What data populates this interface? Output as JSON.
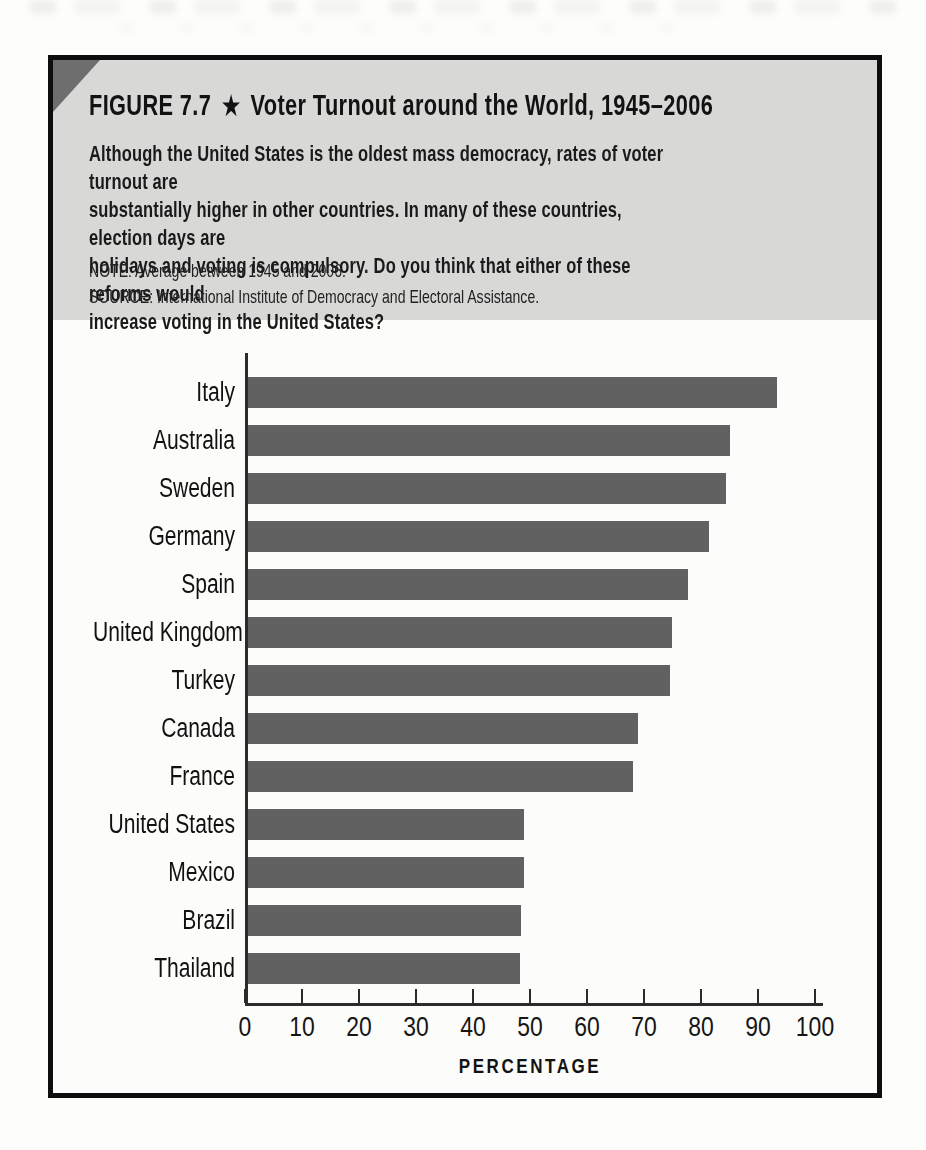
{
  "figure": {
    "label": "FIGURE 7.7",
    "star": "★",
    "title": "Voter Turnout around the World, 1945–2006",
    "description": "Although the United States is the oldest mass democracy, rates of voter turnout are\nsubstantially higher in other countries. In many of these countries, election days are\nholidays and voting is compulsory. Do you think that either of these reforms would\nincrease voting in the United States?",
    "note": "NOTE: Average between 1945 and 2006.",
    "source": "SOURCE: International Institute of Democracy and Electoral Assistance."
  },
  "colors": {
    "header_bg": "#d8d8d7",
    "corner_triangle": "#6e6e6e",
    "border": "#0e0e0e",
    "bar": "#616161",
    "axis": "#2b2b2b"
  },
  "chart_data": {
    "type": "bar",
    "orientation": "horizontal",
    "title": "Voter Turnout around the World, 1945–2006",
    "categories": [
      "Italy",
      "Australia",
      "Sweden",
      "Germany",
      "Spain",
      "United Kingdom",
      "Turkey",
      "Canada",
      "France",
      "United States",
      "Mexico",
      "Brazil",
      "Thailand"
    ],
    "values": [
      93.3,
      85.1,
      84.4,
      81.4,
      77.7,
      74.9,
      74.6,
      68.9,
      68.1,
      48.9,
      48.9,
      48.5,
      48.2
    ],
    "xlabel": "PERCENTAGE",
    "x_ticks": [
      0,
      10,
      20,
      30,
      40,
      50,
      60,
      70,
      80,
      90,
      100
    ],
    "xlim": [
      0,
      100
    ],
    "bar_color": "#616161",
    "grid": false,
    "legend": false
  }
}
